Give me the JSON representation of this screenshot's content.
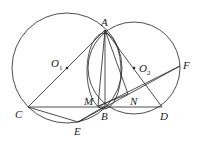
{
  "diagram": {
    "type": "geometry",
    "points": {
      "A": {
        "label": "A",
        "x": 105,
        "y": 30
      },
      "B": {
        "label": "B",
        "x": 105,
        "y": 106
      },
      "C": {
        "label": "C",
        "x": 28,
        "y": 107
      },
      "D": {
        "label": "D",
        "x": 162,
        "y": 107
      },
      "E": {
        "label": "E",
        "x": 78,
        "y": 122
      },
      "F": {
        "label": "F",
        "x": 180,
        "y": 66
      },
      "M": {
        "label": "M",
        "x": 98,
        "y": 106
      },
      "N": {
        "label": "N",
        "x": 128,
        "y": 94
      },
      "O1": {
        "label": "O",
        "sub": "1",
        "x": 67,
        "y": 68
      },
      "O2": {
        "label": "O",
        "sub": "2",
        "x": 134,
        "y": 68
      }
    },
    "circles": [
      {
        "name": "circle-O1",
        "cx": 67,
        "cy": 68,
        "r": 55
      },
      {
        "name": "circle-O2",
        "cx": 134,
        "cy": 68,
        "r": 46
      }
    ],
    "stroke_color": "#222222"
  }
}
